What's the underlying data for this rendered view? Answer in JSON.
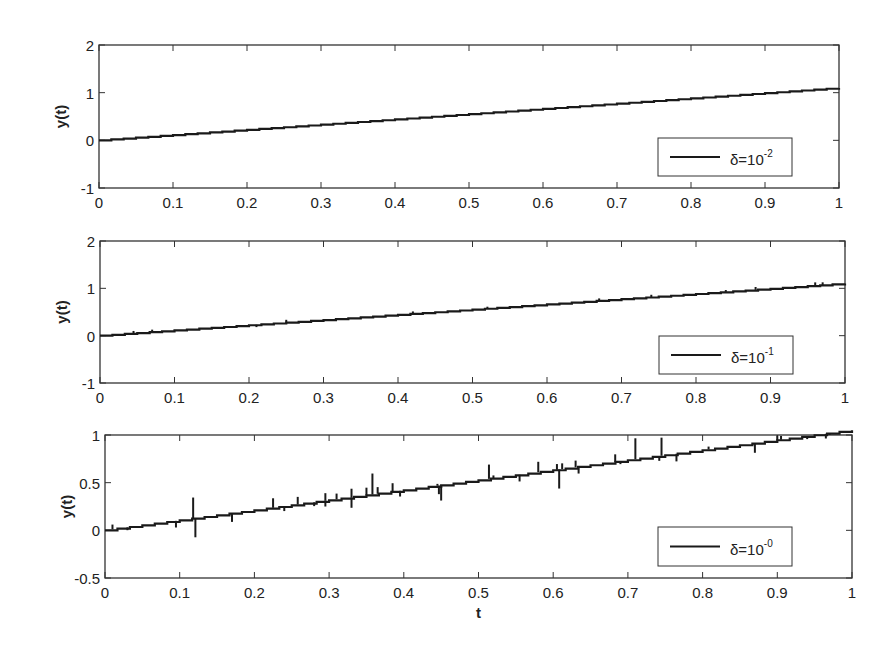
{
  "figure": {
    "background": "#ffffff",
    "line_color": "#1a1a1a",
    "axis_color": "#333333"
  },
  "chart_data": [
    {
      "type": "line",
      "title": "",
      "xlabel": "",
      "ylabel": "y(t)",
      "xlim": [
        0,
        1
      ],
      "ylim": [
        -1,
        2
      ],
      "xticks": [
        0,
        0.1,
        0.2,
        0.3,
        0.4,
        0.5,
        0.6,
        0.7,
        0.8,
        0.9,
        1
      ],
      "xtick_labels": [
        "0",
        "0.1",
        "0.2",
        "0.3",
        "0.4",
        "0.5",
        "0.6",
        "0.7",
        "0.8",
        "0.9",
        "1"
      ],
      "yticks": [
        -1,
        0,
        1,
        2
      ],
      "ytick_labels": [
        "-1",
        "0",
        "1",
        "2"
      ],
      "grid": false,
      "legend": {
        "label": "δ=10",
        "exponent": "-2",
        "position": "lower right"
      },
      "series": [
        {
          "name": "δ=10^-2",
          "x": [
            0,
            0.1,
            0.2,
            0.3,
            0.4,
            0.5,
            0.6,
            0.7,
            0.8,
            0.9,
            1.0
          ],
          "values": [
            0,
            0.11,
            0.22,
            0.33,
            0.44,
            0.55,
            0.66,
            0.77,
            0.88,
            0.99,
            1.1
          ],
          "noise_spikes": []
        }
      ]
    },
    {
      "type": "line",
      "title": "",
      "xlabel": "",
      "ylabel": "y(t)",
      "xlim": [
        0,
        1
      ],
      "ylim": [
        -1,
        2
      ],
      "xticks": [
        0,
        0.1,
        0.2,
        0.3,
        0.4,
        0.5,
        0.6,
        0.7,
        0.8,
        0.9,
        1
      ],
      "xtick_labels": [
        "0",
        "0.1",
        "0.2",
        "0.3",
        "0.4",
        "0.5",
        "0.6",
        "0.7",
        "0.8",
        "0.9",
        "1"
      ],
      "yticks": [
        -1,
        0,
        1,
        2
      ],
      "ytick_labels": [
        "-1",
        "0",
        "1",
        "2"
      ],
      "grid": false,
      "legend": {
        "label": "δ=10",
        "exponent": "-1",
        "position": "lower right"
      },
      "series": [
        {
          "name": "δ=10^-1",
          "x": [
            0,
            0.1,
            0.2,
            0.3,
            0.4,
            0.5,
            0.6,
            0.7,
            0.8,
            0.9,
            1.0
          ],
          "values": [
            0,
            0.11,
            0.22,
            0.33,
            0.44,
            0.55,
            0.66,
            0.77,
            0.88,
            0.99,
            1.1
          ],
          "noise_spikes": [
            [
              0.045,
              0.05
            ],
            [
              0.07,
              0.05
            ],
            [
              0.21,
              -0.05
            ],
            [
              0.25,
              0.06
            ],
            [
              0.42,
              0.05
            ],
            [
              0.52,
              0.04
            ],
            [
              0.67,
              0.05
            ],
            [
              0.74,
              0.05
            ],
            [
              0.84,
              0.04
            ],
            [
              0.88,
              0.06
            ],
            [
              0.96,
              0.07
            ],
            [
              0.97,
              0.06
            ]
          ]
        }
      ]
    },
    {
      "type": "line",
      "title": "",
      "xlabel": "t",
      "ylabel": "y(t)",
      "xlim": [
        0,
        1
      ],
      "ylim": [
        -0.5,
        1
      ],
      "xticks": [
        0,
        0.1,
        0.2,
        0.3,
        0.4,
        0.5,
        0.6,
        0.7,
        0.8,
        0.9,
        1
      ],
      "xtick_labels": [
        "0",
        "0.1",
        "0.2",
        "0.3",
        "0.4",
        "0.5",
        "0.6",
        "0.7",
        "0.8",
        "0.9",
        "1"
      ],
      "yticks": [
        -0.5,
        0,
        0.5,
        1
      ],
      "ytick_labels": [
        "-0.5",
        "0",
        "0.5",
        "1"
      ],
      "grid": false,
      "legend": {
        "label": "δ=10",
        "exponent": "-0",
        "position": "lower right"
      },
      "series": [
        {
          "name": "δ=10^-0",
          "x": [
            0,
            0.1,
            0.2,
            0.3,
            0.4,
            0.5,
            0.6,
            0.7,
            0.8,
            0.9,
            1.0
          ],
          "values": [
            0,
            0.105,
            0.21,
            0.315,
            0.42,
            0.525,
            0.63,
            0.735,
            0.84,
            0.945,
            1.05
          ],
          "noise_spikes": [
            [
              0.01,
              0.05
            ],
            [
              0.03,
              -0.03
            ],
            [
              0.095,
              -0.07
            ],
            [
              0.118,
              0.22
            ],
            [
              0.121,
              -0.2
            ],
            [
              0.17,
              -0.09
            ],
            [
              0.225,
              0.1
            ],
            [
              0.24,
              -0.05
            ],
            [
              0.258,
              0.08
            ],
            [
              0.28,
              -0.04
            ],
            [
              0.295,
              0.08
            ],
            [
              0.295,
              -0.06
            ],
            [
              0.31,
              0.06
            ],
            [
              0.33,
              0.09
            ],
            [
              0.33,
              -0.11
            ],
            [
              0.35,
              0.08
            ],
            [
              0.358,
              0.22
            ],
            [
              0.365,
              0.07
            ],
            [
              0.385,
              0.09
            ],
            [
              0.395,
              -0.06
            ],
            [
              0.445,
              0.02
            ],
            [
              0.447,
              -0.09
            ],
            [
              0.45,
              -0.16
            ],
            [
              0.514,
              0.15
            ],
            [
              0.52,
              0.03
            ],
            [
              0.555,
              -0.07
            ],
            [
              0.58,
              0.11
            ],
            [
              0.605,
              0.06
            ],
            [
              0.608,
              -0.2
            ],
            [
              0.612,
              0.06
            ],
            [
              0.63,
              0.07
            ],
            [
              0.634,
              -0.07
            ],
            [
              0.683,
              0.08
            ],
            [
              0.69,
              -0.03
            ],
            [
              0.71,
              0.22
            ],
            [
              0.745,
              0.19
            ],
            [
              0.742,
              -0.05
            ],
            [
              0.765,
              -0.08
            ],
            [
              0.808,
              0.03
            ],
            [
              0.87,
              -0.1
            ],
            [
              0.9,
              0.05
            ],
            [
              0.905,
              0.04
            ],
            [
              0.94,
              -0.03
            ],
            [
              0.965,
              -0.05
            ],
            [
              0.97,
              0.03
            ]
          ]
        }
      ]
    }
  ],
  "subplots": [
    {
      "box": {
        "left": 99,
        "top": 45,
        "right": 839,
        "bottom": 188
      }
    },
    {
      "box": {
        "left": 100,
        "top": 241,
        "right": 845,
        "bottom": 383
      }
    },
    {
      "box": {
        "left": 105,
        "top": 435,
        "right": 852,
        "bottom": 578
      }
    }
  ],
  "legends": [
    {
      "box": {
        "left": 658,
        "top": 138,
        "right": 792,
        "bottom": 176
      }
    },
    {
      "box": {
        "left": 659,
        "top": 336,
        "right": 793,
        "bottom": 374
      }
    },
    {
      "box": {
        "left": 658,
        "top": 527,
        "right": 792,
        "bottom": 566
      }
    }
  ]
}
